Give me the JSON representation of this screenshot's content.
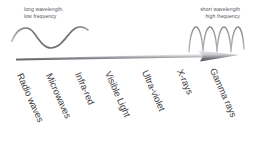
{
  "figure": {
    "background_color": "#ffffff",
    "line_color": "#6f6d74",
    "text_color": "#3f3d44",
    "caption_color": "#55535a"
  },
  "captions": {
    "left": {
      "line1": "long wavelength,",
      "line2": "low frequency"
    },
    "right": {
      "line1": "short wavelength",
      "line2": "high frequency"
    }
  },
  "waves": {
    "long": {
      "name": "long-wavelength-wave",
      "cycles": 1,
      "amplitude": 9,
      "wavelength": 78
    },
    "short": {
      "name": "short-wavelength-wave",
      "cycles": 4,
      "amplitude": 12,
      "wavelength": 13
    }
  },
  "arrow": {
    "name": "spectrum-arrow",
    "direction": "right",
    "start_x": 16,
    "end_x": 239,
    "label": "increasing frequency"
  },
  "bands": [
    {
      "label": "Radio waves",
      "x": 20,
      "y": 68
    },
    {
      "label": "Microwaves",
      "x": 49,
      "y": 68
    },
    {
      "label": "Infra-red",
      "x": 78,
      "y": 67
    },
    {
      "label": "Visible Light",
      "x": 108,
      "y": 66
    },
    {
      "label": "Ultra-violet",
      "x": 145,
      "y": 65
    },
    {
      "label": "X-rays",
      "x": 180,
      "y": 64
    },
    {
      "label": "Gamma rays",
      "x": 213,
      "y": 63
    }
  ]
}
